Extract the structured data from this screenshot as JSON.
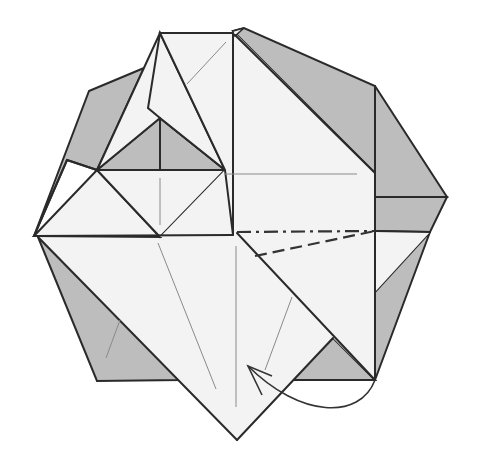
{
  "diagram": {
    "colors": {
      "paper_front": "#f3f3f3",
      "paper_back": "#bdbdbd",
      "edge": "#2a2a2a",
      "crease": "#8a8a8a",
      "background": "#ffffff"
    },
    "symbols": {
      "valley_fold_line": "dashed",
      "mountain_fold_line": "dash-dot",
      "fold_arrow": "curved-arrow-from-bottom-right-corner-to-bottom-left"
    }
  }
}
